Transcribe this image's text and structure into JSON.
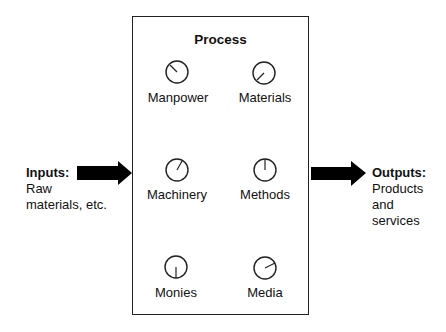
{
  "diagram": {
    "title": "Process",
    "inputs": {
      "heading": "Inputs:",
      "lines": [
        "Raw",
        "materials, etc."
      ]
    },
    "outputs": {
      "heading": "Outputs:",
      "lines": [
        "Products",
        "and",
        "services"
      ]
    },
    "dials": [
      {
        "label": "Manpower",
        "needle_angle_deg": -45
      },
      {
        "label": "Materials",
        "needle_angle_deg": 225
      },
      {
        "label": "Machinery",
        "needle_angle_deg": 30
      },
      {
        "label": "Methods",
        "needle_angle_deg": 0
      },
      {
        "label": "Monies",
        "needle_angle_deg": 180
      },
      {
        "label": "Media",
        "needle_angle_deg": 65
      }
    ],
    "colors": {
      "stroke": "#222222",
      "arrow": "#000000",
      "background": "#ffffff"
    }
  }
}
